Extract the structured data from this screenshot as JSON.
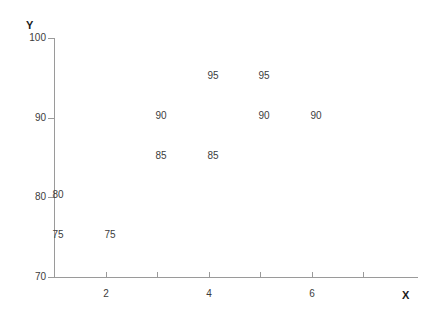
{
  "chart_data": {
    "type": "scatter",
    "title": "",
    "xlabel": "X",
    "ylabel": "Y",
    "xlim": [
      1,
      7
    ],
    "ylim": [
      70,
      100
    ],
    "grid": false,
    "legend": null,
    "x_ticks": [
      {
        "value": 1,
        "label": ""
      },
      {
        "value": 2,
        "label": "2"
      },
      {
        "value": 3,
        "label": ""
      },
      {
        "value": 4,
        "label": "4"
      },
      {
        "value": 5,
        "label": ""
      },
      {
        "value": 6,
        "label": "6"
      },
      {
        "value": 7,
        "label": ""
      }
    ],
    "y_ticks": [
      {
        "value": 70,
        "label": "70"
      },
      {
        "value": 80,
        "label": "80"
      },
      {
        "value": 90,
        "label": "90"
      },
      {
        "value": 100,
        "label": "100"
      }
    ],
    "points": [
      {
        "x": 1,
        "y": 75,
        "label": "75"
      },
      {
        "x": 1,
        "y": 80,
        "label": "80"
      },
      {
        "x": 2,
        "y": 75,
        "label": "75"
      },
      {
        "x": 3,
        "y": 90,
        "label": "90"
      },
      {
        "x": 3,
        "y": 85,
        "label": "85"
      },
      {
        "x": 4,
        "y": 95,
        "label": "95"
      },
      {
        "x": 4,
        "y": 85,
        "label": "85"
      },
      {
        "x": 5,
        "y": 95,
        "label": "95"
      },
      {
        "x": 5,
        "y": 90,
        "label": "90"
      },
      {
        "x": 6,
        "y": 90,
        "label": "90"
      }
    ],
    "marker_style": "value-text-only",
    "colors": {
      "axis": "#9a9a9a",
      "text": "#3c3c3c",
      "axis_title": "#1a1a1a",
      "background": "#ffffff"
    }
  }
}
